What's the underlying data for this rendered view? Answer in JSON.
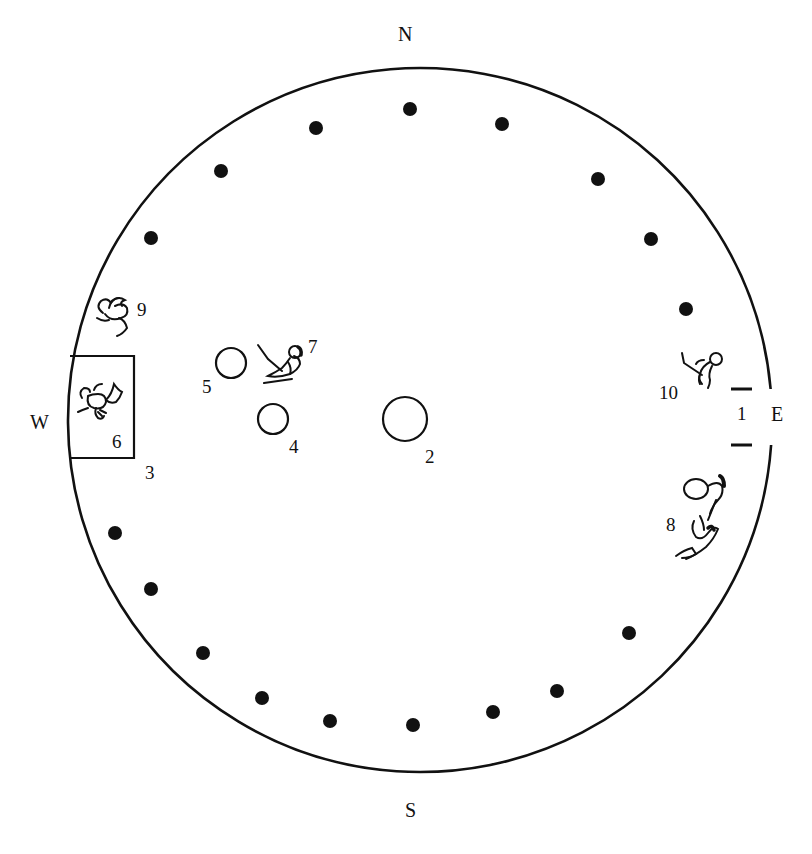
{
  "diagram": {
    "colors": {
      "ink": "#111111",
      "background": "#ffffff"
    },
    "outline": {
      "cx": 420,
      "cy": 420,
      "r": 352
    },
    "directions": [
      {
        "key": "N",
        "label": "N",
        "x": 398,
        "y": 24
      },
      {
        "key": "S",
        "label": "S",
        "x": 405,
        "y": 800
      },
      {
        "key": "W",
        "label": "W",
        "x": 30,
        "y": 412
      },
      {
        "key": "E",
        "label": "E",
        "x": 771,
        "y": 404
      }
    ],
    "posts": [
      [
        410,
        109
      ],
      [
        502,
        124
      ],
      [
        598,
        179
      ],
      [
        651,
        239
      ],
      [
        686,
        309
      ],
      [
        316,
        128
      ],
      [
        221,
        171
      ],
      [
        151,
        238
      ],
      [
        115,
        533
      ],
      [
        151,
        589
      ],
      [
        203,
        653
      ],
      [
        262,
        698
      ],
      [
        330,
        721
      ],
      [
        413,
        725
      ],
      [
        493,
        712
      ],
      [
        557,
        691
      ],
      [
        629,
        633
      ]
    ],
    "features": [
      {
        "id": "1",
        "name": "entrance",
        "label": "1",
        "label_x": 737,
        "label_y": 404
      },
      {
        "id": "2",
        "name": "central-hearth",
        "label": "2",
        "cx": 405,
        "cy": 419,
        "r": 22,
        "label_x": 425,
        "label_y": 447
      },
      {
        "id": "3",
        "name": "altar-platform",
        "label": "3",
        "x": 68,
        "y": 356,
        "w": 66,
        "h": 102,
        "label_x": 145,
        "label_y": 463
      },
      {
        "id": "4",
        "name": "small-hearth-4",
        "label": "4",
        "cx": 273,
        "cy": 419,
        "r": 15,
        "label_x": 289,
        "label_y": 437
      },
      {
        "id": "5",
        "name": "small-hearth-5",
        "label": "5",
        "cx": 231,
        "cy": 363,
        "r": 15,
        "label_x": 202,
        "label_y": 377
      },
      {
        "id": "6",
        "name": "figure-6",
        "label": "6",
        "label_x": 112,
        "label_y": 432
      },
      {
        "id": "7",
        "name": "figure-7",
        "label": "7",
        "label_x": 308,
        "label_y": 337
      },
      {
        "id": "8",
        "name": "figure-8",
        "label": "8",
        "label_x": 666,
        "label_y": 515
      },
      {
        "id": "9",
        "name": "figure-9",
        "label": "9",
        "label_x": 137,
        "label_y": 300
      },
      {
        "id": "10",
        "name": "figure-10",
        "label": "10",
        "label_x": 659,
        "label_y": 383
      }
    ]
  }
}
